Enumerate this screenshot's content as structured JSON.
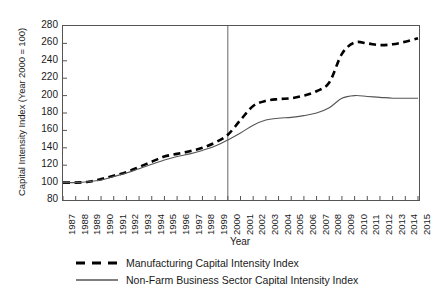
{
  "chart_data": {
    "type": "line",
    "title": "",
    "xlabel": "Year",
    "ylabel": "Capital Intensity Index (Year 2000 = 100)",
    "ylim": [
      80,
      280
    ],
    "y_ticks": [
      280,
      260,
      240,
      220,
      200,
      180,
      160,
      140,
      120,
      100,
      80
    ],
    "grid": false,
    "legend_position": "bottom",
    "categories": [
      "1987",
      "1988",
      "1989",
      "1990",
      "1991",
      "1992",
      "1993",
      "1994",
      "1995",
      "1996",
      "1997",
      "1998",
      "1999",
      "2000",
      "2001",
      "2002",
      "2003",
      "2004",
      "2005",
      "2006",
      "2007",
      "2008",
      "2009",
      "2010",
      "2011",
      "2012",
      "2013",
      "2014",
      "2015"
    ],
    "annotations": [
      {
        "type": "vertical-line",
        "at": "2000",
        "label": ""
      }
    ],
    "series": [
      {
        "name": "Manufacturing Capital Intensity Index",
        "style": "dashed",
        "color": "#000000",
        "values": [
          100,
          100,
          101,
          104,
          108,
          112,
          118,
          124,
          130,
          133,
          136,
          140,
          146,
          155,
          172,
          188,
          194,
          196,
          197,
          200,
          205,
          215,
          248,
          261,
          260,
          258,
          259,
          262,
          266
        ]
      },
      {
        "name": "Non-Farm Business Sector Capital Intensity Index",
        "style": "solid",
        "color": "#555555",
        "values": [
          100,
          100,
          101,
          103,
          107,
          111,
          116,
          121,
          126,
          130,
          133,
          137,
          142,
          149,
          157,
          166,
          172,
          174,
          175,
          177,
          180,
          186,
          197,
          200,
          199,
          198,
          197,
          197,
          197
        ]
      }
    ]
  },
  "legend": {
    "items": [
      {
        "label": "Manufacturing Capital Intensity Index",
        "style": "dashed"
      },
      {
        "label": "Non-Farm Business Sector Capital Intensity Index",
        "style": "solid"
      }
    ]
  }
}
